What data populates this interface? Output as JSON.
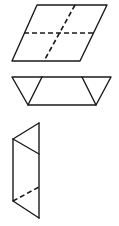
{
  "diagram": {
    "stroke_color": "#1a1a1a",
    "background": "#ffffff",
    "figures": [
      {
        "name": "parallelogram-with-fold-lines",
        "outline": [
          [
            37,
            5
          ],
          [
            107,
            5
          ],
          [
            80,
            61
          ],
          [
            12,
            61
          ]
        ],
        "dashed_lines": [
          [
            [
              24,
              33
            ],
            [
              94,
              33
            ]
          ],
          [
            [
              75,
              5
            ],
            [
              44,
              61
            ]
          ]
        ]
      },
      {
        "name": "trapezoid-strip",
        "outline": [
          [
            12,
            77
          ],
          [
            111,
            77
          ],
          [
            96,
            105
          ],
          [
            28,
            105
          ]
        ],
        "solid_lines": [
          [
            [
              42,
              77
            ],
            [
              28,
              105
            ]
          ],
          [
            [
              82,
              77
            ],
            [
              96,
              105
            ]
          ]
        ]
      },
      {
        "name": "vertical-folded-shape",
        "solid_lines": [
          [
            [
              39,
              123
            ],
            [
              39,
              218
            ]
          ],
          [
            [
              13,
              139
            ],
            [
              13,
              201
            ]
          ],
          [
            [
              13,
              139
            ],
            [
              39,
              123
            ]
          ],
          [
            [
              13,
              139
            ],
            [
              39,
              154
            ]
          ],
          [
            [
              13,
              201
            ],
            [
              39,
              218
            ]
          ]
        ],
        "dashed_lines": [
          [
            [
              13,
              201
            ],
            [
              39,
              187
            ]
          ]
        ]
      }
    ]
  }
}
